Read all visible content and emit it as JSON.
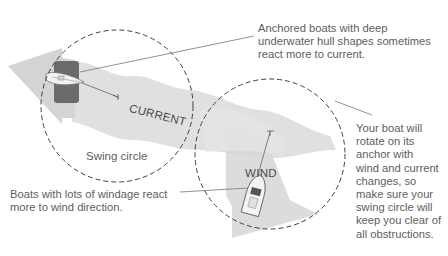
{
  "diagram": {
    "type": "anchoring-swing-circle-illustration",
    "colors": {
      "current_band": "#dcdcdc",
      "wind_arrow": "#d6d6d6",
      "hull_shape": "#6a6a6a",
      "dashed_circle": "#444444",
      "leader_line": "#777777",
      "text": "#5e5e5e"
    },
    "flow_labels": {
      "current": "CURRENT",
      "wind": "WIND"
    },
    "swing_circle_label": "Swing circle",
    "callouts": {
      "top": {
        "lines": [
          "Anchored boats with deep",
          "underwater hull shapes sometimes",
          "react more to current."
        ]
      },
      "bottom": {
        "lines": [
          "Boats with lots of windage react",
          "more to wind direction."
        ]
      },
      "right": {
        "lines": [
          "Your boat will",
          "rotate on its",
          "anchor with",
          "wind and current",
          "changes, so",
          "make sure your",
          "swing circle will",
          "keep you clear of",
          "all obstructions."
        ]
      }
    },
    "icons": {
      "sailboat": "sailboat-icon",
      "motorboat": "motorboat-icon",
      "anchor_left": "anchor-icon",
      "anchor_right": "anchor-icon"
    }
  }
}
